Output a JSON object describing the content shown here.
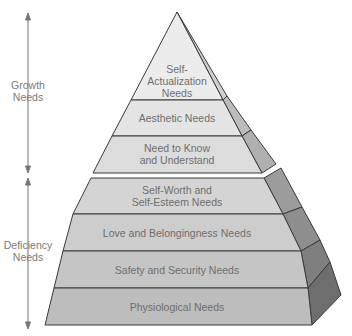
{
  "side_labels": {
    "growth": [
      "Growth",
      "Needs"
    ],
    "deficiency": [
      "Deficiency",
      "Needs"
    ]
  },
  "levels": [
    {
      "lines": [
        "Self-",
        "Actualization",
        "Needs"
      ],
      "group": "growth"
    },
    {
      "lines": [
        "Aesthetic Needs"
      ],
      "group": "growth"
    },
    {
      "lines": [
        "Need to Know",
        "and Understand"
      ],
      "group": "growth"
    },
    {
      "lines": [
        "Self-Worth and",
        "Self-Esteem Needs"
      ],
      "group": "deficiency"
    },
    {
      "lines": [
        "Love and Belongingness Needs"
      ],
      "group": "deficiency"
    },
    {
      "lines": [
        "Safety and Security Needs"
      ],
      "group": "deficiency"
    },
    {
      "lines": [
        "Physiological Needs"
      ],
      "group": "deficiency"
    }
  ],
  "colors": {
    "outline": "#3a3a3a",
    "growth_front": [
      "#ececec",
      "#e4e4e4",
      "#dcdcdc"
    ],
    "growth_side": [
      "#c8c8c8",
      "#bdbdbd",
      "#b2b2b2"
    ],
    "def_front": [
      "#d4d4d4",
      "#cccccc",
      "#c4c4c4",
      "#bcbcbc"
    ],
    "def_side": [
      "#9a9a9a",
      "#8c8c8c",
      "#7e7e7e",
      "#707070"
    ],
    "text": "#6e6e6e",
    "arrow": "#777777"
  }
}
